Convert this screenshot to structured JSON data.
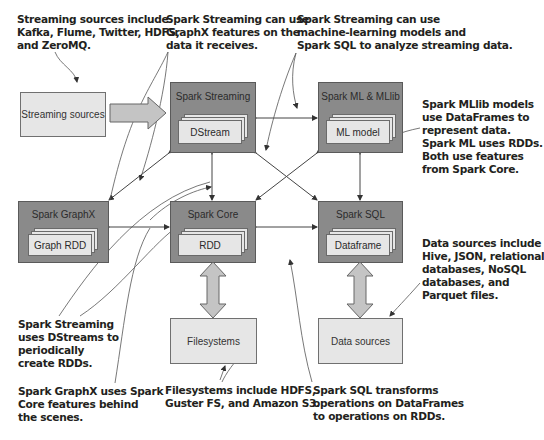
{
  "notes": {
    "streaming_sources": "Streaming sources include\nKafka, Flume, Twitter, HDFS,\nand ZeroMQ.",
    "streaming_graphx": "Spark Streaming can use\nGraphX features on the\ndata it receives.",
    "streaming_ml_sql": "Spark Streaming can use\nmachine-learning models and\nSpark SQL to analyze streaming data.",
    "mllib": "Spark MLlib models\nuse DataFrames to\nrepresent data.\nSpark ML uses RDDs.\nBoth use features\nfrom Spark Core.",
    "data_sources": "Data sources include\nHive, JSON, relational\ndatabases, NoSQL\ndatabases, and\nParquet files.",
    "dstreams": "Spark Streaming\nuses DStreams to\nperiodically\ncreate RDDs.",
    "graphx_core": "Spark GraphX uses Spark\nCore features behind\nthe scenes.",
    "filesystems": "Filesystems include HDFS,\nGuster FS, and Amazon S3.",
    "sql_transform": "Spark SQL transforms\noperations on DataFrames\nto operations on RDDs."
  },
  "components": {
    "streaming_sources": "Streaming sources",
    "spark_streaming": {
      "title": "Spark Streaming",
      "inner": "DStream"
    },
    "spark_ml": {
      "title": "Spark ML & MLlib",
      "inner": "ML model"
    },
    "spark_graphx": {
      "title": "Spark GraphX",
      "inner": "Graph RDD"
    },
    "spark_core": {
      "title": "Spark Core",
      "inner": "RDD"
    },
    "spark_sql": {
      "title": "Spark SQL",
      "inner": "Dataframe"
    },
    "filesystems": "Filesystems",
    "data_sources": "Data sources"
  },
  "colors": {
    "dark_box": "#8a8a8a",
    "light_box": "#e6e6e6",
    "text": "#231f20"
  }
}
